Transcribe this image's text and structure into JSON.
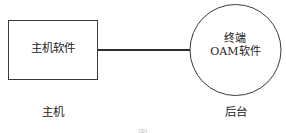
{
  "figure": {
    "type": "block-diagram",
    "background_color": "#ffffff",
    "stroke_color": "#3a3a3a",
    "text_color": "#222222",
    "nodes": [
      {
        "id": "host-software",
        "shape": "rectangle",
        "label": "主机软件",
        "x": 8,
        "y": 20,
        "width": 90,
        "height": 60
      },
      {
        "id": "terminal-oam",
        "shape": "circle",
        "label_line1": "终端",
        "label_line2": "OAM软件",
        "center_x": 235,
        "center_y": 50,
        "diameter": 91
      }
    ],
    "connector": {
      "id": "host-to-terminal-link",
      "from": "host-software",
      "to": "terminal-oam",
      "orientation": "horizontal",
      "x1": 98,
      "x2": 190,
      "y": 50
    },
    "zone_labels": [
      {
        "id": "host-zone",
        "label": "主机"
      },
      {
        "id": "backend-zone",
        "label": "后台"
      }
    ],
    "caption": "图"
  }
}
